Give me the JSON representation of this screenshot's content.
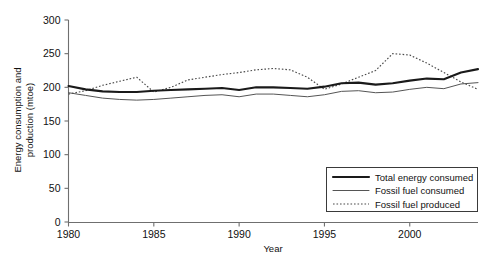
{
  "chart_data": {
    "type": "line",
    "title": "",
    "xlabel": "Year",
    "ylabel": "Energy consumption and production (mtoe)",
    "xlim": [
      1980,
      2004
    ],
    "ylim": [
      0,
      300
    ],
    "grid": false,
    "legend_position": "bottom-right",
    "xticks": [
      "1980",
      "1985",
      "1990",
      "1995",
      "2000"
    ],
    "xtick_values": [
      1980,
      1985,
      1990,
      1995,
      2000
    ],
    "yticks": [
      "0",
      "50",
      "100",
      "150",
      "200",
      "250",
      "300"
    ],
    "ytick_values": [
      0,
      50,
      100,
      150,
      200,
      250,
      300
    ],
    "x": [
      1980,
      1981,
      1982,
      1983,
      1984,
      1985,
      1986,
      1987,
      1988,
      1989,
      1990,
      1991,
      1992,
      1993,
      1994,
      1995,
      1996,
      1997,
      1998,
      1999,
      2000,
      2001,
      2002,
      2003,
      2004
    ],
    "series": [
      {
        "name": "Total energy consumed",
        "style": "solid-thick",
        "color": "#1a1a1a",
        "values": [
          202,
          197,
          194,
          193,
          193,
          195,
          196,
          197,
          198,
          199,
          196,
          200,
          200,
          199,
          198,
          201,
          206,
          207,
          204,
          206,
          210,
          213,
          212,
          222,
          227
        ]
      },
      {
        "name": "Fossil fuel consumed",
        "style": "solid-thin",
        "color": "#555555",
        "values": [
          192,
          188,
          184,
          182,
          181,
          182,
          184,
          186,
          188,
          189,
          186,
          190,
          190,
          188,
          186,
          189,
          194,
          195,
          192,
          193,
          197,
          200,
          198,
          205,
          207
        ]
      },
      {
        "name": "Fossil fuel produced",
        "style": "dotted",
        "color": "#4a4a4a",
        "values": [
          190,
          195,
          203,
          209,
          215,
          193,
          200,
          211,
          215,
          219,
          222,
          226,
          228,
          226,
          215,
          197,
          205,
          215,
          225,
          250,
          248,
          236,
          222,
          208,
          197
        ]
      }
    ]
  },
  "legend": {
    "entries": [
      {
        "label": "Total energy consumed"
      },
      {
        "label": "Fossil fuel consumed"
      },
      {
        "label": "Fossil fuel produced"
      }
    ]
  }
}
